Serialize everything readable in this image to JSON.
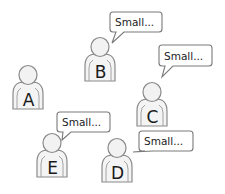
{
  "diagram": {
    "title": "",
    "persons": [
      {
        "id": "A",
        "label": "A",
        "x": 28,
        "y": 75,
        "bubble": null
      },
      {
        "id": "B",
        "label": "B",
        "x": 100,
        "y": 47,
        "bubble": {
          "text": "Small...",
          "x": 110,
          "y": 12,
          "w": 52,
          "h": 20,
          "tailX": 112,
          "tailY": 43
        }
      },
      {
        "id": "C",
        "label": "C",
        "x": 152,
        "y": 92,
        "bubble": {
          "text": "Small...",
          "x": 159,
          "y": 45,
          "w": 53,
          "h": 21,
          "tailX": 162,
          "tailY": 77
        }
      },
      {
        "id": "E",
        "label": "E",
        "x": 52,
        "y": 143,
        "bubble": {
          "text": "Small...",
          "x": 57,
          "y": 112,
          "w": 53,
          "h": 20,
          "tailX": 62,
          "tailY": 140
        }
      },
      {
        "id": "D",
        "label": "D",
        "x": 117,
        "y": 148,
        "bubble": {
          "text": "Small...",
          "x": 139,
          "y": 131,
          "w": 54,
          "h": 20,
          "tailX": 133,
          "tailY": 152
        }
      }
    ]
  }
}
